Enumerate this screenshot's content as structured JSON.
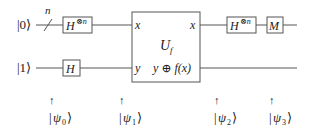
{
  "circuit": {
    "inputs": [
      {
        "label": "|0⟩",
        "qubits": "n"
      },
      {
        "label": "|1⟩"
      }
    ],
    "gates": {
      "hadamard_n_left": {
        "base": "H",
        "sup": "⊗n"
      },
      "hadamard_single": {
        "base": "H"
      },
      "oracle": {
        "name_base": "U",
        "name_sub": "f",
        "in_top": "x",
        "in_bottom": "y",
        "out_top": "x",
        "out_bottom": "y ⊕ f(x)"
      },
      "hadamard_n_right": {
        "base": "H",
        "sup": "⊗n"
      },
      "measure": {
        "label": "M"
      }
    },
    "states": [
      {
        "arrow": "↑",
        "ket_open": "|",
        "psi": "ψ",
        "index": "0",
        "ket_close": "⟩"
      },
      {
        "arrow": "↑",
        "ket_open": "|",
        "psi": "ψ",
        "index": "1",
        "ket_close": "⟩"
      },
      {
        "arrow": "↑",
        "ket_open": "|",
        "psi": "ψ",
        "index": "2",
        "ket_close": "⟩"
      },
      {
        "arrow": "↑",
        "ket_open": "|",
        "psi": "ψ",
        "index": "3",
        "ket_close": "⟩"
      }
    ]
  }
}
